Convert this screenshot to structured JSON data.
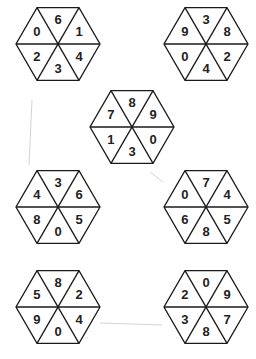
{
  "puzzle": {
    "description": "Seven hexagons each divided into six triangular segments with digits",
    "segment_order": [
      "top",
      "upper-right",
      "lower-right",
      "bottom",
      "lower-left",
      "upper-left"
    ],
    "hexagons": [
      {
        "id": "hex-top-left",
        "cx": 58,
        "cy": 44,
        "segments": {
          "top": "6",
          "upper-right": "1",
          "lower-right": "4",
          "bottom": "3",
          "lower-left": "2",
          "upper-left": "0"
        }
      },
      {
        "id": "hex-top-right",
        "cx": 206,
        "cy": 44,
        "segments": {
          "top": "3",
          "upper-right": "8",
          "lower-right": "2",
          "bottom": "4",
          "lower-left": "0",
          "upper-left": "9"
        }
      },
      {
        "id": "hex-middle",
        "cx": 132,
        "cy": 127,
        "segments": {
          "top": "8",
          "upper-right": "9",
          "lower-right": "0",
          "bottom": "3",
          "lower-left": "1",
          "upper-left": "7"
        }
      },
      {
        "id": "hex-mid-left",
        "cx": 58,
        "cy": 207,
        "segments": {
          "top": "3",
          "upper-right": "6",
          "lower-right": "5",
          "bottom": "0",
          "lower-left": "8",
          "upper-left": "4"
        }
      },
      {
        "id": "hex-mid-right",
        "cx": 206,
        "cy": 207,
        "segments": {
          "top": "7",
          "upper-right": "4",
          "lower-right": "5",
          "bottom": "8",
          "lower-left": "6",
          "upper-left": "0"
        }
      },
      {
        "id": "hex-bottom-left",
        "cx": 58,
        "cy": 307,
        "segments": {
          "top": "8",
          "upper-right": "2",
          "lower-right": "4",
          "bottom": "0",
          "lower-left": "9",
          "upper-left": "5"
        }
      },
      {
        "id": "hex-bottom-right",
        "cx": 206,
        "cy": 307,
        "segments": {
          "top": "0",
          "upper-right": "9",
          "lower-right": "7",
          "bottom": "8",
          "lower-left": "3",
          "upper-left": "2"
        }
      }
    ]
  }
}
